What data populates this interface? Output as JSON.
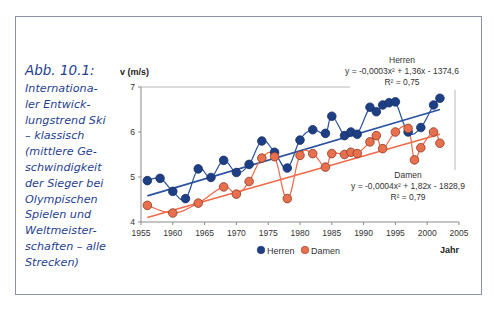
{
  "caption": {
    "title": "Abb. 10.1:",
    "lines": [
      "Internationa-",
      "ler Entwick-",
      "lungstrend Ski",
      "– klassisch",
      "(mittlere Ge-",
      "schwindigkeit",
      "der Sieger bei",
      "Olympischen",
      "Spielen und",
      "Weltmeister-",
      "schaften – alle",
      "Strecken)"
    ]
  },
  "colors": {
    "herren": "#1f3f84",
    "damen": "#e8704f",
    "herren_line": "#2a52a0",
    "damen_line": "#f06a4a",
    "caption": "#1f3f8f",
    "frame": "#8c90a8"
  },
  "chart_data": {
    "type": "scatter",
    "title": "",
    "xlabel": "Jahr",
    "ylabel": "v (m/s)",
    "xlim": [
      1955,
      2005
    ],
    "ylim": [
      4,
      7
    ],
    "x_ticks": [
      "1955",
      "1960",
      "1965",
      "1970",
      "1975",
      "1980",
      "1985",
      "1990",
      "1995",
      "2000",
      "2005"
    ],
    "y_ticks": [
      "4",
      "5",
      "6",
      "7"
    ],
    "grid": "horizontal at 7 only",
    "legend": [
      "Herren",
      "Damen"
    ],
    "legend_position": "bottom",
    "series": [
      {
        "name": "Herren",
        "trend": {
          "label": "Herren",
          "equation": "y = -0,0003x² + 1,36x - 1374,6",
          "r2": "R² = 0,75"
        },
        "x": [
          1956,
          1958,
          1960,
          1962,
          1964,
          1966,
          1968,
          1970,
          1972,
          1974,
          1976,
          1978,
          1980,
          1982,
          1984,
          1985,
          1987,
          1988,
          1989,
          1991,
          1992,
          1993,
          1994,
          1995,
          1997,
          1999,
          2001,
          2002
        ],
        "values": [
          4.92,
          4.97,
          4.68,
          4.52,
          5.18,
          4.99,
          5.37,
          5.1,
          5.28,
          5.8,
          5.55,
          5.2,
          5.82,
          6.05,
          5.97,
          6.35,
          5.92,
          6.0,
          5.95,
          6.55,
          6.45,
          6.6,
          6.65,
          6.67,
          6.0,
          6.1,
          6.6,
          6.75
        ]
      },
      {
        "name": "Damen",
        "trend": {
          "label": "Damen",
          "equation": "y = -0,0004x² + 1,82x - 1828,9",
          "r2": "R² = 0,79"
        },
        "x": [
          1956,
          1960,
          1964,
          1968,
          1970,
          1972,
          1974,
          1976,
          1978,
          1980,
          1982,
          1984,
          1985,
          1987,
          1988,
          1989,
          1991,
          1992,
          1993,
          1995,
          1997,
          1998,
          1999,
          2001,
          2002
        ],
        "values": [
          4.37,
          4.2,
          4.42,
          4.78,
          4.62,
          4.9,
          5.42,
          5.45,
          4.52,
          5.48,
          5.52,
          5.22,
          5.52,
          5.5,
          5.55,
          5.52,
          5.78,
          5.92,
          5.63,
          6.0,
          6.08,
          5.38,
          5.65,
          6.0,
          5.75
        ]
      }
    ]
  }
}
